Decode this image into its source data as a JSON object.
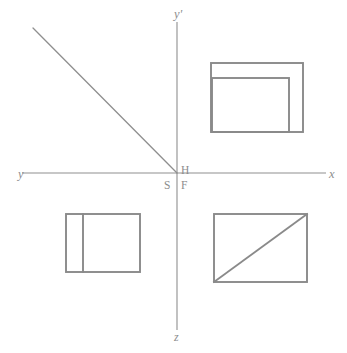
{
  "figure": {
    "canvas": {
      "width": 347,
      "height": 353,
      "background": "#ffffff"
    },
    "line_color": "#8a8a8a",
    "axis_color": "#8f8f8f",
    "label_color": "#8d8d8d"
  },
  "axes": {
    "origin": {
      "x": 177,
      "y": 173
    },
    "horizontal": {
      "name": "horizontal-axis",
      "x1": 22,
      "y1": 173,
      "x2": 326,
      "y2": 173,
      "left_label": "y",
      "right_label": "x"
    },
    "vertical": {
      "name": "vertical-axis",
      "x1": 177,
      "y1": 22,
      "x2": 177,
      "y2": 330,
      "top_label": "y'",
      "bottom_label": "z"
    }
  },
  "point_labels": [
    {
      "key": "h",
      "text": "H",
      "x": 181,
      "y": 165,
      "quadrant": "upper-right"
    },
    {
      "key": "s",
      "text": "S",
      "x": 164,
      "y": 180,
      "quadrant": "lower-left"
    },
    {
      "key": "f",
      "text": "F",
      "x": 181,
      "y": 180,
      "quadrant": "lower-right"
    }
  ],
  "ray": {
    "name": "projection-ray",
    "description": "diagonal line from upper-left to origin",
    "x1": 33,
    "y1": 28,
    "x2": 177,
    "y2": 173
  },
  "views": {
    "top_right": {
      "name": "top-view-with-inner-rectangle",
      "outer": {
        "x": 211,
        "y": 63,
        "width": 92,
        "height": 69
      },
      "inner": {
        "x": 212,
        "y": 78,
        "width": 77,
        "height": 54
      }
    },
    "bottom_left": {
      "name": "side-view-with-vertical-divider",
      "outer": {
        "x": 66,
        "y": 214,
        "width": 74,
        "height": 58
      },
      "divider": {
        "x": 83,
        "y1": 214,
        "y2": 272
      }
    },
    "bottom_right": {
      "name": "front-view-with-diagonal",
      "outer": {
        "x": 214,
        "y": 214,
        "width": 93,
        "height": 68
      },
      "diagonal": {
        "x1": 214,
        "y1": 282,
        "x2": 307,
        "y2": 214
      }
    }
  }
}
